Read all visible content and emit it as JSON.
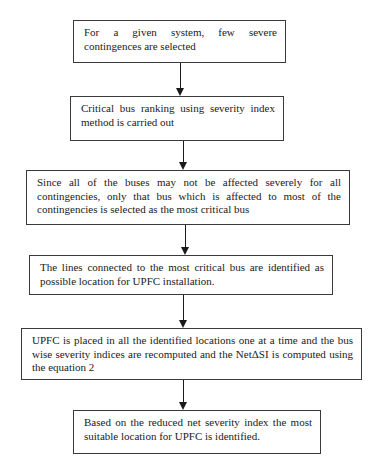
{
  "flowchart": {
    "steps": [
      {
        "id": "step-1",
        "text": "For a given system, few severe contingences are selected"
      },
      {
        "id": "step-2",
        "text": "Critical bus ranking using severity index method is carried out"
      },
      {
        "id": "step-3",
        "text": "Since all of the buses may not be affected severely for all contingencies, only that bus which is affected to most of the contingencies is selected as the most critical bus"
      },
      {
        "id": "step-4",
        "text": "The lines connected to the most critical bus are identified as possible location for UPFC installation."
      },
      {
        "id": "step-5",
        "text": "UPFC is placed in all the identified locations one at a time and the bus wise severity indices are recomputed and the NetΔSI is computed using the equation 2"
      },
      {
        "id": "step-6",
        "text": "Based on the reduced net severity index the most suitable location for UPFC is identified."
      }
    ],
    "connectors": [
      {
        "from": "step-1",
        "to": "step-2",
        "type": "arrow-down"
      },
      {
        "from": "step-2",
        "to": "step-3",
        "type": "arrow-down"
      },
      {
        "from": "step-3",
        "to": "step-4",
        "type": "arrow-down"
      },
      {
        "from": "step-4",
        "to": "step-5",
        "type": "arrow-down"
      },
      {
        "from": "step-5",
        "to": "step-6",
        "type": "arrow-down"
      }
    ],
    "colors": {
      "background": "#ffffff",
      "border": "#3a3a3a",
      "text": "#1a1a1a",
      "arrow": "#1a1a1a"
    }
  }
}
